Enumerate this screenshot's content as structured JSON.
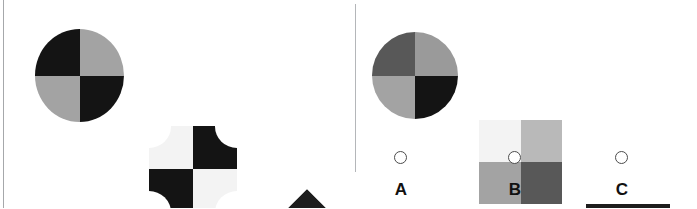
{
  "layout": {
    "width": 697,
    "height": 208,
    "background": "#ffffff",
    "divider_color": "#b4b6b9",
    "left_rule_color": "#a6a8ab"
  },
  "palette": {
    "black": "#141414",
    "near_black": "#1d1d1d",
    "dark_gray": "#4a4a4a",
    "mid_dark_gray": "#585858",
    "gray": "#9a9a9a",
    "mid_gray": "#a3a3a3",
    "light_gray": "#b9b9b9",
    "pale_gray": "#e3e3e3",
    "white": "#ffffff",
    "off_white": "#f3f3f3"
  },
  "stem": {
    "name": "analogy-stem",
    "figures": [
      {
        "name": "stem-figure-1",
        "shape": "circle",
        "quadrants": {
          "top_left": "#141414",
          "top_right": "#a3a3a3",
          "bottom_left": "#a3a3a3",
          "bottom_right": "#141414"
        }
      },
      {
        "name": "stem-figure-2",
        "shape": "concave-corner-square",
        "quadrants": {
          "top_left": "#f3f3f3",
          "top_right": "#141414",
          "bottom_left": "#141414",
          "bottom_right": "#f3f3f3"
        }
      },
      {
        "name": "stem-figure-3",
        "shape": "diamond",
        "quadrants": {
          "top_left": "#1d1d1d",
          "top_right": "#e3e3e3",
          "bottom_left": "#e3e3e3",
          "bottom_right": "#1d1d1d"
        },
        "marks": [
          {
            "name": "plus-mark-top-left",
            "glyph": "plus",
            "color": "#ffffff"
          },
          {
            "name": "plus-mark-top-right",
            "glyph": "plus",
            "color": "#f3f3f3"
          },
          {
            "name": "plus-mark-bottom-left",
            "glyph": "plus",
            "color": "#f3f3f3"
          },
          {
            "name": "plus-mark-bottom-right",
            "glyph": "plus",
            "color": "#ffffff"
          }
        ]
      }
    ]
  },
  "options": [
    {
      "name": "option-a",
      "label": "A",
      "shape": "circle",
      "quadrants": {
        "top_left": "#585858",
        "top_right": "#9a9a9a",
        "bottom_left": "#a3a3a3",
        "bottom_right": "#141414"
      },
      "radio": {
        "name": "radio-a",
        "selected": false
      }
    },
    {
      "name": "option-b",
      "label": "B",
      "shape": "square",
      "quadrants": {
        "top_left": "#f3f3f3",
        "top_right": "#b9b9b9",
        "bottom_left": "#a3a3a3",
        "bottom_right": "#585858"
      },
      "radio": {
        "name": "radio-b",
        "selected": false
      }
    },
    {
      "name": "option-c",
      "label": "C",
      "shape": "square",
      "quadrants": {
        "top_left": "#1d1d1d",
        "top_right": "#1d1d1d",
        "bottom_left": "#1d1d1d",
        "bottom_right": "#1d1d1d"
      },
      "radio": {
        "name": "radio-c",
        "selected": false
      }
    }
  ]
}
